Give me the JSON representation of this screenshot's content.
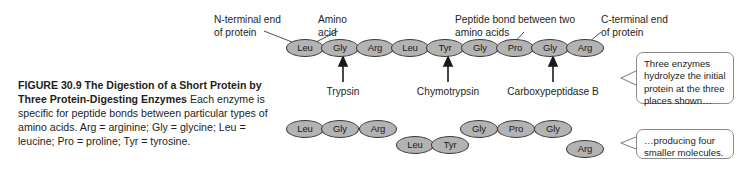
{
  "figure": {
    "caption_lead": "FIGURE 30.9  The Digestion of a Short Protein by Three Protein-Digesting Enzymes",
    "caption_body": "  Each enzyme is specific for peptide bonds between particular types of amino acids. Arg = arginine; Gly = glycine; Leu = leucine; Pro = proline; Tyr = tyrosine."
  },
  "annotations": {
    "n_terminal": "N-terminal end\nof protein",
    "amino_acid": "Amino\nacid",
    "peptide_bond": "Peptide bond between two\namino acids",
    "c_terminal": "C-terminal end\nof protein"
  },
  "enzymes": [
    {
      "name": "Trypsin"
    },
    {
      "name": "Chymotrypsin"
    },
    {
      "name": "Carboxypeptidase B"
    }
  ],
  "chain": {
    "residues": [
      {
        "label": "Leu"
      },
      {
        "label": "Gly"
      },
      {
        "label": "Arg"
      },
      {
        "label": "Leu"
      },
      {
        "label": "Tyr"
      },
      {
        "label": "Gly"
      },
      {
        "label": "Pro"
      },
      {
        "label": "Gly"
      },
      {
        "label": "Arg"
      }
    ]
  },
  "fragments": [
    {
      "residues": [
        {
          "label": "Leu"
        },
        {
          "label": "Gly"
        },
        {
          "label": "Arg"
        }
      ]
    },
    {
      "residues": [
        {
          "label": "Leu"
        },
        {
          "label": "Tyr"
        }
      ]
    },
    {
      "residues": [
        {
          "label": "Gly"
        },
        {
          "label": "Pro"
        },
        {
          "label": "Gly"
        }
      ]
    },
    {
      "residues": [
        {
          "label": "Arg"
        }
      ]
    }
  ],
  "callouts": {
    "top": "Three enzymes hydrolyze the initial protein at the three places shown…",
    "bottom": "…producing four smaller molecules."
  },
  "colors": {
    "residue_fill": "#b3b3b3",
    "residue_stroke": "#3b3b3b",
    "text": "#231f20",
    "callout_border": "#8c8c8c",
    "background": "#ffffff"
  }
}
